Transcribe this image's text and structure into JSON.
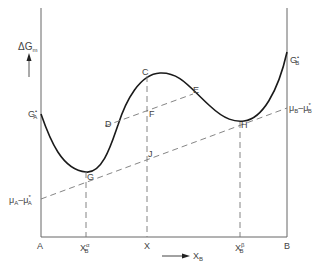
{
  "diagram": {
    "type": "free-energy-composition",
    "y_axis_label": "ΔG",
    "y_axis_sub": "m",
    "x_axis_label": "X",
    "x_axis_sub": "B",
    "colors": {
      "curve": "#1a1a1a",
      "axis": "#666666",
      "dashed": "#777777",
      "text": "#444444"
    },
    "points": {
      "C": "C",
      "D": "D",
      "E": "E",
      "F": "F",
      "G": "G",
      "H": "H",
      "J": "J"
    },
    "left_labels": {
      "GA_main": "G",
      "GA_sub": "A",
      "GA_sup": "•",
      "muA_main": "μ",
      "muA_sub": "A",
      "muA_dash": "–",
      "muA2_main": "μ",
      "muA2_sub": "A",
      "muA2_sup": "*"
    },
    "right_labels": {
      "GB_main": "G",
      "GB_sub": "B",
      "GB_sup": "•",
      "muB_main": "μ",
      "muB_sub": "B",
      "muB_dash": "–",
      "muB2_main": "μ",
      "muB2_sub": "B",
      "muB2_sup": "*"
    },
    "bottom_labels": {
      "A": "A",
      "XBa_main": "X",
      "XBa_sub": "B",
      "XBa_sup": "α",
      "X": "X",
      "XBb_main": "X",
      "XBb_sub": "B",
      "XBb_sup": "β",
      "B": "B"
    }
  }
}
